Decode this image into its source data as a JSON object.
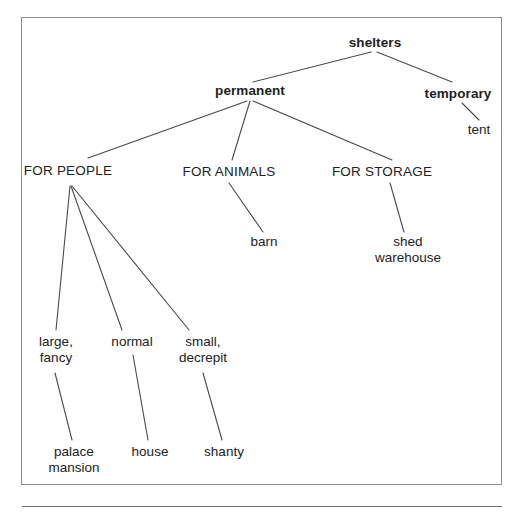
{
  "figure": {
    "background_color": "#ffffff",
    "frame_border_color": "#8c8c8c",
    "line_color": "#4a4a4a",
    "text_color": "#222222"
  },
  "nodes": {
    "root": "shelters",
    "permanent": "permanent",
    "temporary": "temporary",
    "tent": "tent",
    "for_people": "FOR PEOPLE",
    "for_animals": "FOR ANIMALS",
    "for_storage": "FOR STORAGE",
    "barn": "barn",
    "shed_warehouse": "shed\nwarehouse",
    "large_fancy": "large,\nfancy",
    "normal": "normal",
    "small_decrepit": "small,\ndecrepit",
    "palace_mansion": "palace\nmansion",
    "house": "house",
    "shanty": "shanty"
  },
  "tree": {
    "name": "shelters",
    "children": [
      {
        "name": "permanent",
        "children": [
          {
            "name": "FOR PEOPLE",
            "children": [
              {
                "name": "large, fancy",
                "children": [
                  {
                    "name": "palace mansion"
                  }
                ]
              },
              {
                "name": "normal",
                "children": [
                  {
                    "name": "house"
                  }
                ]
              },
              {
                "name": "small, decrepit",
                "children": [
                  {
                    "name": "shanty"
                  }
                ]
              }
            ]
          },
          {
            "name": "FOR ANIMALS",
            "children": [
              {
                "name": "barn"
              }
            ]
          },
          {
            "name": "FOR STORAGE",
            "children": [
              {
                "name": "shed warehouse"
              }
            ]
          }
        ]
      },
      {
        "name": "temporary",
        "children": [
          {
            "name": "tent"
          }
        ]
      }
    ]
  },
  "edges": [
    {
      "from": "shelters",
      "to": "permanent"
    },
    {
      "from": "shelters",
      "to": "temporary"
    },
    {
      "from": "temporary",
      "to": "tent"
    },
    {
      "from": "permanent",
      "to": "FOR PEOPLE"
    },
    {
      "from": "permanent",
      "to": "FOR ANIMALS"
    },
    {
      "from": "permanent",
      "to": "FOR STORAGE"
    },
    {
      "from": "FOR ANIMALS",
      "to": "barn"
    },
    {
      "from": "FOR STORAGE",
      "to": "shed warehouse"
    },
    {
      "from": "FOR PEOPLE",
      "to": "large, fancy"
    },
    {
      "from": "FOR PEOPLE",
      "to": "normal"
    },
    {
      "from": "FOR PEOPLE",
      "to": "small, decrepit"
    },
    {
      "from": "large, fancy",
      "to": "palace mansion"
    },
    {
      "from": "normal",
      "to": "house"
    },
    {
      "from": "small, decrepit",
      "to": "shanty"
    }
  ]
}
